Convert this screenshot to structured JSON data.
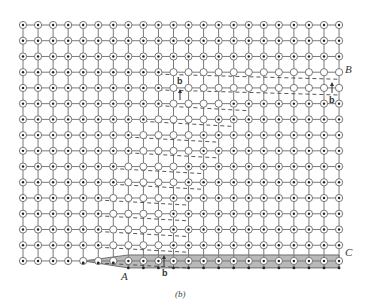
{
  "figure": {
    "caption": "(b)",
    "labels": {
      "A": "A",
      "B": "B",
      "C": "C",
      "burgers_top": "b",
      "burgers_right": "b",
      "burgers_bottom": "b"
    },
    "grid": {
      "columns": 22,
      "rows": 16,
      "x0": 23,
      "y0": 25,
      "dx": 15.05,
      "dy": 15.73
    },
    "colors": {
      "line": "#7a7a7a",
      "circle_stroke": "#6a6a6a",
      "dot": "#222222",
      "shaded": "#b9b9b9",
      "dash": "#444444"
    }
  }
}
